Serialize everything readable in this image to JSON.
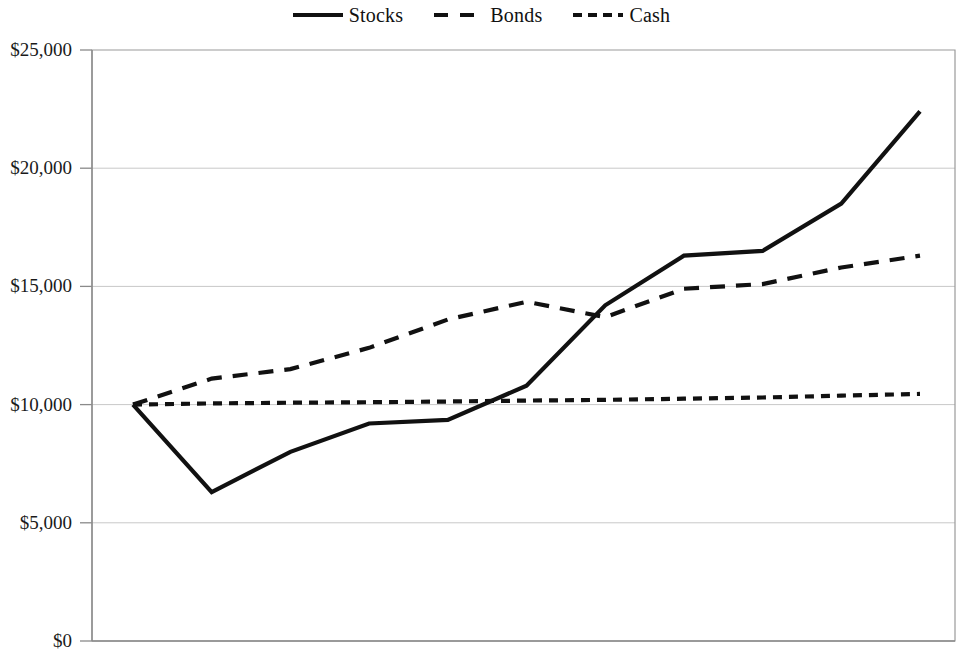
{
  "chart_data": {
    "type": "line",
    "title": "",
    "subtitle": "",
    "xlabel": "",
    "ylabel": "",
    "ylim": [
      0,
      25000
    ],
    "ytick_labels": [
      "$0",
      "$5,000",
      "$10,000",
      "$15,000",
      "$20,000",
      "$25,000"
    ],
    "ytick_values": [
      0,
      5000,
      10000,
      15000,
      20000,
      25000
    ],
    "xtick_labels": [],
    "grid": "horizontal",
    "legend_position": "top-center",
    "x": [
      0,
      1,
      2,
      3,
      4,
      5,
      6,
      7,
      8,
      9,
      10
    ],
    "series": [
      {
        "name": "Stocks",
        "style": "solid",
        "color": "#111111",
        "values": [
          10000,
          6300,
          8000,
          9200,
          9350,
          10800,
          14200,
          16300,
          16500,
          18500,
          22400
        ]
      },
      {
        "name": "Bonds",
        "style": "dashed-long",
        "color": "#111111",
        "values": [
          10000,
          11100,
          11500,
          12400,
          13600,
          14350,
          13700,
          14900,
          15100,
          15800,
          16300
        ]
      },
      {
        "name": "Cash",
        "style": "dashed-short",
        "color": "#111111",
        "values": [
          10000,
          10050,
          10080,
          10100,
          10130,
          10170,
          10200,
          10250,
          10300,
          10380,
          10450
        ]
      }
    ]
  },
  "legend": {
    "entries": [
      {
        "label": "Stocks",
        "style": "solid"
      },
      {
        "label": "Bonds",
        "style": "dashed-long"
      },
      {
        "label": "Cash",
        "style": "dashed-short"
      }
    ]
  },
  "axis": {
    "y_labels": [
      "$25,000",
      "$20,000",
      "$15,000",
      "$10,000",
      "$5,000",
      "$0"
    ]
  }
}
